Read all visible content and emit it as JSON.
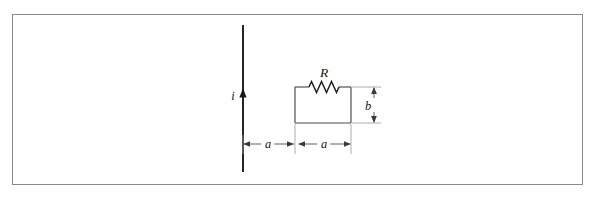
{
  "figure": {
    "background_color": "#ffffff",
    "border_color": "#8a8a8a",
    "ink_color": "#1a1a1a",
    "dimension_color": "#5a5a5a"
  },
  "labels": {
    "current": "i",
    "resistor": "R",
    "height": "b",
    "distance_left": "a",
    "width_right": "a"
  },
  "elements": {
    "wire_name": "current-carrying-wire",
    "loop_name": "rectangular-loop",
    "resistor_name": "resistor-symbol"
  },
  "geometry": {
    "frame": {
      "x": 12,
      "y": 14,
      "width": 571,
      "height": 171
    },
    "wire": {
      "x": 243,
      "y_top": 25,
      "y_bottom": 172
    },
    "current_arrow_y": 96,
    "loop": {
      "x": 295,
      "y": 87,
      "width": 56,
      "height": 36
    },
    "resistor": {
      "x_start": 309,
      "x_end": 339,
      "y": 87,
      "peaks": 3,
      "amplitude": 6
    },
    "dim_b": {
      "x": 374,
      "y_top": 87,
      "y_bottom": 123
    },
    "dim_a_left": {
      "y": 144,
      "x_start": 243,
      "x_end": 294
    },
    "dim_a_right": {
      "y": 144,
      "x_start": 299,
      "x_end": 351
    }
  }
}
